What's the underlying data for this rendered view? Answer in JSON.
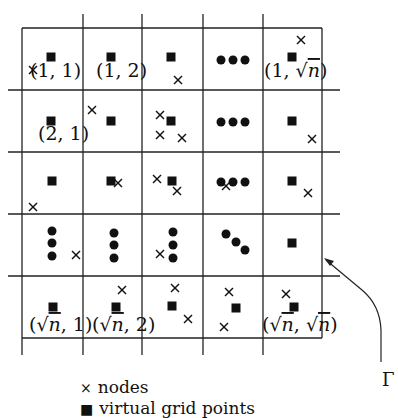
{
  "diagram": {
    "grid": {
      "rows": 5,
      "cols": 5,
      "x_lines": [
        22,
        83,
        142,
        203,
        263,
        322
      ],
      "y_lines": [
        28,
        90,
        152,
        214,
        276,
        338
      ],
      "line_color": "#222222"
    },
    "cell_labels": [
      {
        "id": "r1c1",
        "text_pre": "(1, 1)",
        "x": 30,
        "y": 77
      },
      {
        "id": "r1c2",
        "text_pre": "(1, 2)",
        "x": 96,
        "y": 77
      },
      {
        "id": "r1cn",
        "text_pre": "(1, ",
        "sqrt": "n",
        "text_post": ")",
        "x": 264,
        "y": 77
      },
      {
        "id": "r2c1",
        "text_pre": "(2, 1)",
        "x": 38,
        "y": 140
      },
      {
        "id": "rnc1",
        "text_pre": "(",
        "sqrt": "n",
        "text_post": ", 1)",
        "x": 29,
        "y": 331
      },
      {
        "id": "rnc2",
        "text_pre": "(",
        "sqrt": "n",
        "text_post": ", 2)",
        "x": 92,
        "y": 331
      },
      {
        "id": "rncn",
        "text_pre": "(",
        "sqrt": "n",
        "text_post": ", ",
        "sqrt2": "n",
        "text_post2": ")",
        "x": 262,
        "y": 331
      }
    ],
    "grid_points": [
      [
        51,
        57
      ],
      [
        111,
        57
      ],
      [
        171,
        57
      ],
      [
        292,
        57
      ],
      [
        51,
        121
      ],
      [
        111,
        121
      ],
      [
        171,
        121
      ],
      [
        292,
        121
      ],
      [
        52,
        181
      ],
      [
        111,
        181
      ],
      [
        172,
        181
      ],
      [
        292,
        181
      ],
      [
        292,
        243
      ],
      [
        53,
        307
      ],
      [
        116,
        307
      ],
      [
        172,
        306
      ],
      [
        236,
        308
      ],
      [
        294,
        307
      ]
    ],
    "dot_groups": [
      {
        "cell": "r1c4",
        "dots": [
          [
            221,
            60
          ],
          [
            233,
            60
          ],
          [
            245,
            60
          ]
        ]
      },
      {
        "cell": "r2c4",
        "dots": [
          [
            221,
            122
          ],
          [
            233,
            122
          ],
          [
            245,
            122
          ]
        ]
      },
      {
        "cell": "r3c4",
        "dots": [
          [
            221,
            182
          ],
          [
            233,
            182
          ],
          [
            245,
            182
          ]
        ]
      },
      {
        "cell": "r4c1",
        "dots": [
          [
            52,
            231
          ],
          [
            52,
            243
          ],
          [
            52,
            256
          ]
        ]
      },
      {
        "cell": "r4c2",
        "dots": [
          [
            114,
            233
          ],
          [
            114,
            245
          ],
          [
            114,
            258
          ]
        ]
      },
      {
        "cell": "r4c3",
        "dots": [
          [
            173,
            232
          ],
          [
            173,
            245
          ],
          [
            173,
            258
          ]
        ]
      },
      {
        "cell": "r4c4",
        "dots": [
          [
            226,
            234
          ],
          [
            236,
            242
          ],
          [
            245,
            250
          ]
        ]
      }
    ],
    "nodes": [
      [
        33,
        70
      ],
      [
        178,
        80
      ],
      [
        301,
        40
      ],
      [
        92,
        110
      ],
      [
        160,
        115
      ],
      [
        160,
        135
      ],
      [
        182,
        138
      ],
      [
        312,
        139
      ],
      [
        33,
        207
      ],
      [
        118,
        183
      ],
      [
        157,
        179
      ],
      [
        177,
        191
      ],
      [
        226,
        186
      ],
      [
        308,
        193
      ],
      [
        76,
        255
      ],
      [
        160,
        254
      ],
      [
        122,
        290
      ],
      [
        175,
        288
      ],
      [
        188,
        319
      ],
      [
        229,
        292
      ],
      [
        224,
        327
      ],
      [
        286,
        294
      ]
    ],
    "pointer": {
      "label": "Γ",
      "from": [
        381,
        360
      ],
      "to": [
        324,
        258
      ]
    }
  },
  "legend": {
    "items": [
      {
        "symbol": "×",
        "label": "nodes"
      },
      {
        "symbol": "■",
        "label": "virtual grid points"
      }
    ]
  }
}
